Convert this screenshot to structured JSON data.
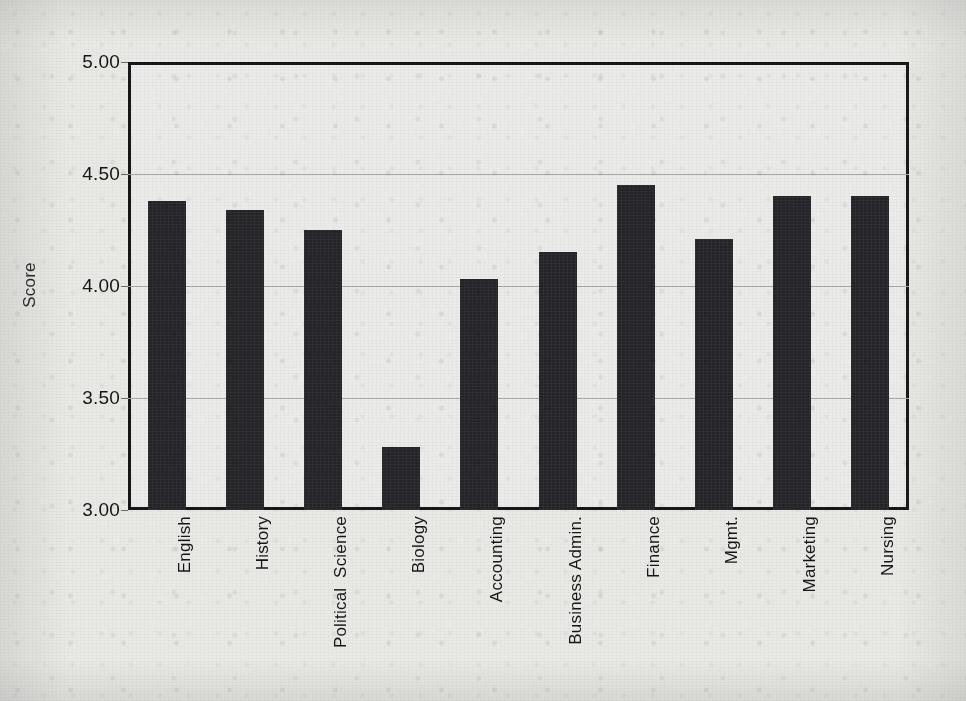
{
  "chart_data": {
    "type": "bar",
    "title": "",
    "xlabel": "",
    "ylabel": "Score",
    "ylim": [
      3.0,
      5.0
    ],
    "ytick_labels": [
      "5.00",
      "4.50",
      "4.00",
      "3.50",
      "3.00"
    ],
    "ytick_values": [
      5.0,
      4.5,
      4.0,
      3.5,
      3.0
    ],
    "grid": "horizontal gridlines at 4.50, 4.00, 3.50",
    "legend": "none",
    "bar_color": "#242428",
    "plot_background": "#e9e9e6",
    "categories": [
      "English",
      "History",
      "Political  Science",
      "Biology",
      "Accounting",
      "Business Admin.",
      "Finance",
      "Mgmt.",
      "Marketing",
      "Nursing"
    ],
    "values": [
      4.38,
      4.34,
      4.25,
      3.28,
      4.03,
      4.15,
      4.45,
      4.21,
      4.4,
      4.4
    ]
  }
}
